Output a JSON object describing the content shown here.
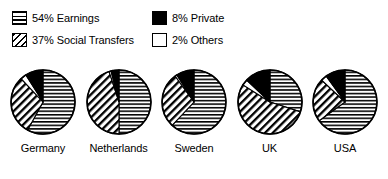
{
  "legend": {
    "items": [
      {
        "label": "54% Earnings",
        "key": "earnings",
        "pattern": "horizontal-hatch",
        "swatch": "sw-horiz"
      },
      {
        "label": "8% Private",
        "key": "private",
        "pattern": "solid-black",
        "swatch": "sw-solid"
      },
      {
        "label": "37% Social Transfers",
        "key": "social_transfers",
        "pattern": "diagonal-hatch",
        "swatch": "sw-diag"
      },
      {
        "label": "2% Others",
        "key": "others",
        "pattern": "white-empty",
        "swatch": "sw-empty"
      }
    ]
  },
  "chart_data": {
    "type": "pie",
    "title": "",
    "subtitle": "",
    "xlabel": "",
    "ylabel": "",
    "grid": false,
    "legend_position": "top",
    "legend_entries": [
      "54% Earnings",
      "37% Social Transfers",
      "8% Private",
      "2% Others"
    ],
    "categories": [
      "Earnings",
      "Social Transfers",
      "Private",
      "Others"
    ],
    "overall_values": [
      54,
      37,
      8,
      2
    ],
    "colors": {
      "earnings": "#000000",
      "social_transfers": "#000000",
      "private": "#000000",
      "others": "#ffffff",
      "outline": "#000000",
      "background": "#ffffff"
    },
    "patterns": {
      "earnings": "horizontal-hatch",
      "social_transfers": "diagonal-hatch",
      "private": "solid-black",
      "others": "white-empty"
    },
    "pies": [
      {
        "label": "Germany",
        "values": {
          "earnings": 58,
          "social_transfers": 30,
          "private": 9,
          "others": 3
        },
        "slices": [
          58,
          30,
          9,
          3
        ]
      },
      {
        "label": "Netherlands",
        "values": {
          "earnings": 50,
          "social_transfers": 45,
          "private": 4,
          "others": 1
        },
        "slices": [
          50,
          45,
          4,
          1
        ]
      },
      {
        "label": "Sweden",
        "values": {
          "earnings": 62,
          "social_transfers": 28,
          "private": 9,
          "others": 1
        },
        "slices": [
          62,
          28,
          9,
          1
        ]
      },
      {
        "label": "UK",
        "values": {
          "earnings": 30,
          "social_transfers": 54,
          "private": 13,
          "others": 3
        },
        "slices": [
          30,
          54,
          13,
          3
        ]
      },
      {
        "label": "USA",
        "values": {
          "earnings": 65,
          "social_transfers": 22,
          "private": 10,
          "others": 3
        },
        "slices": [
          65,
          22,
          10,
          3
        ]
      }
    ]
  }
}
